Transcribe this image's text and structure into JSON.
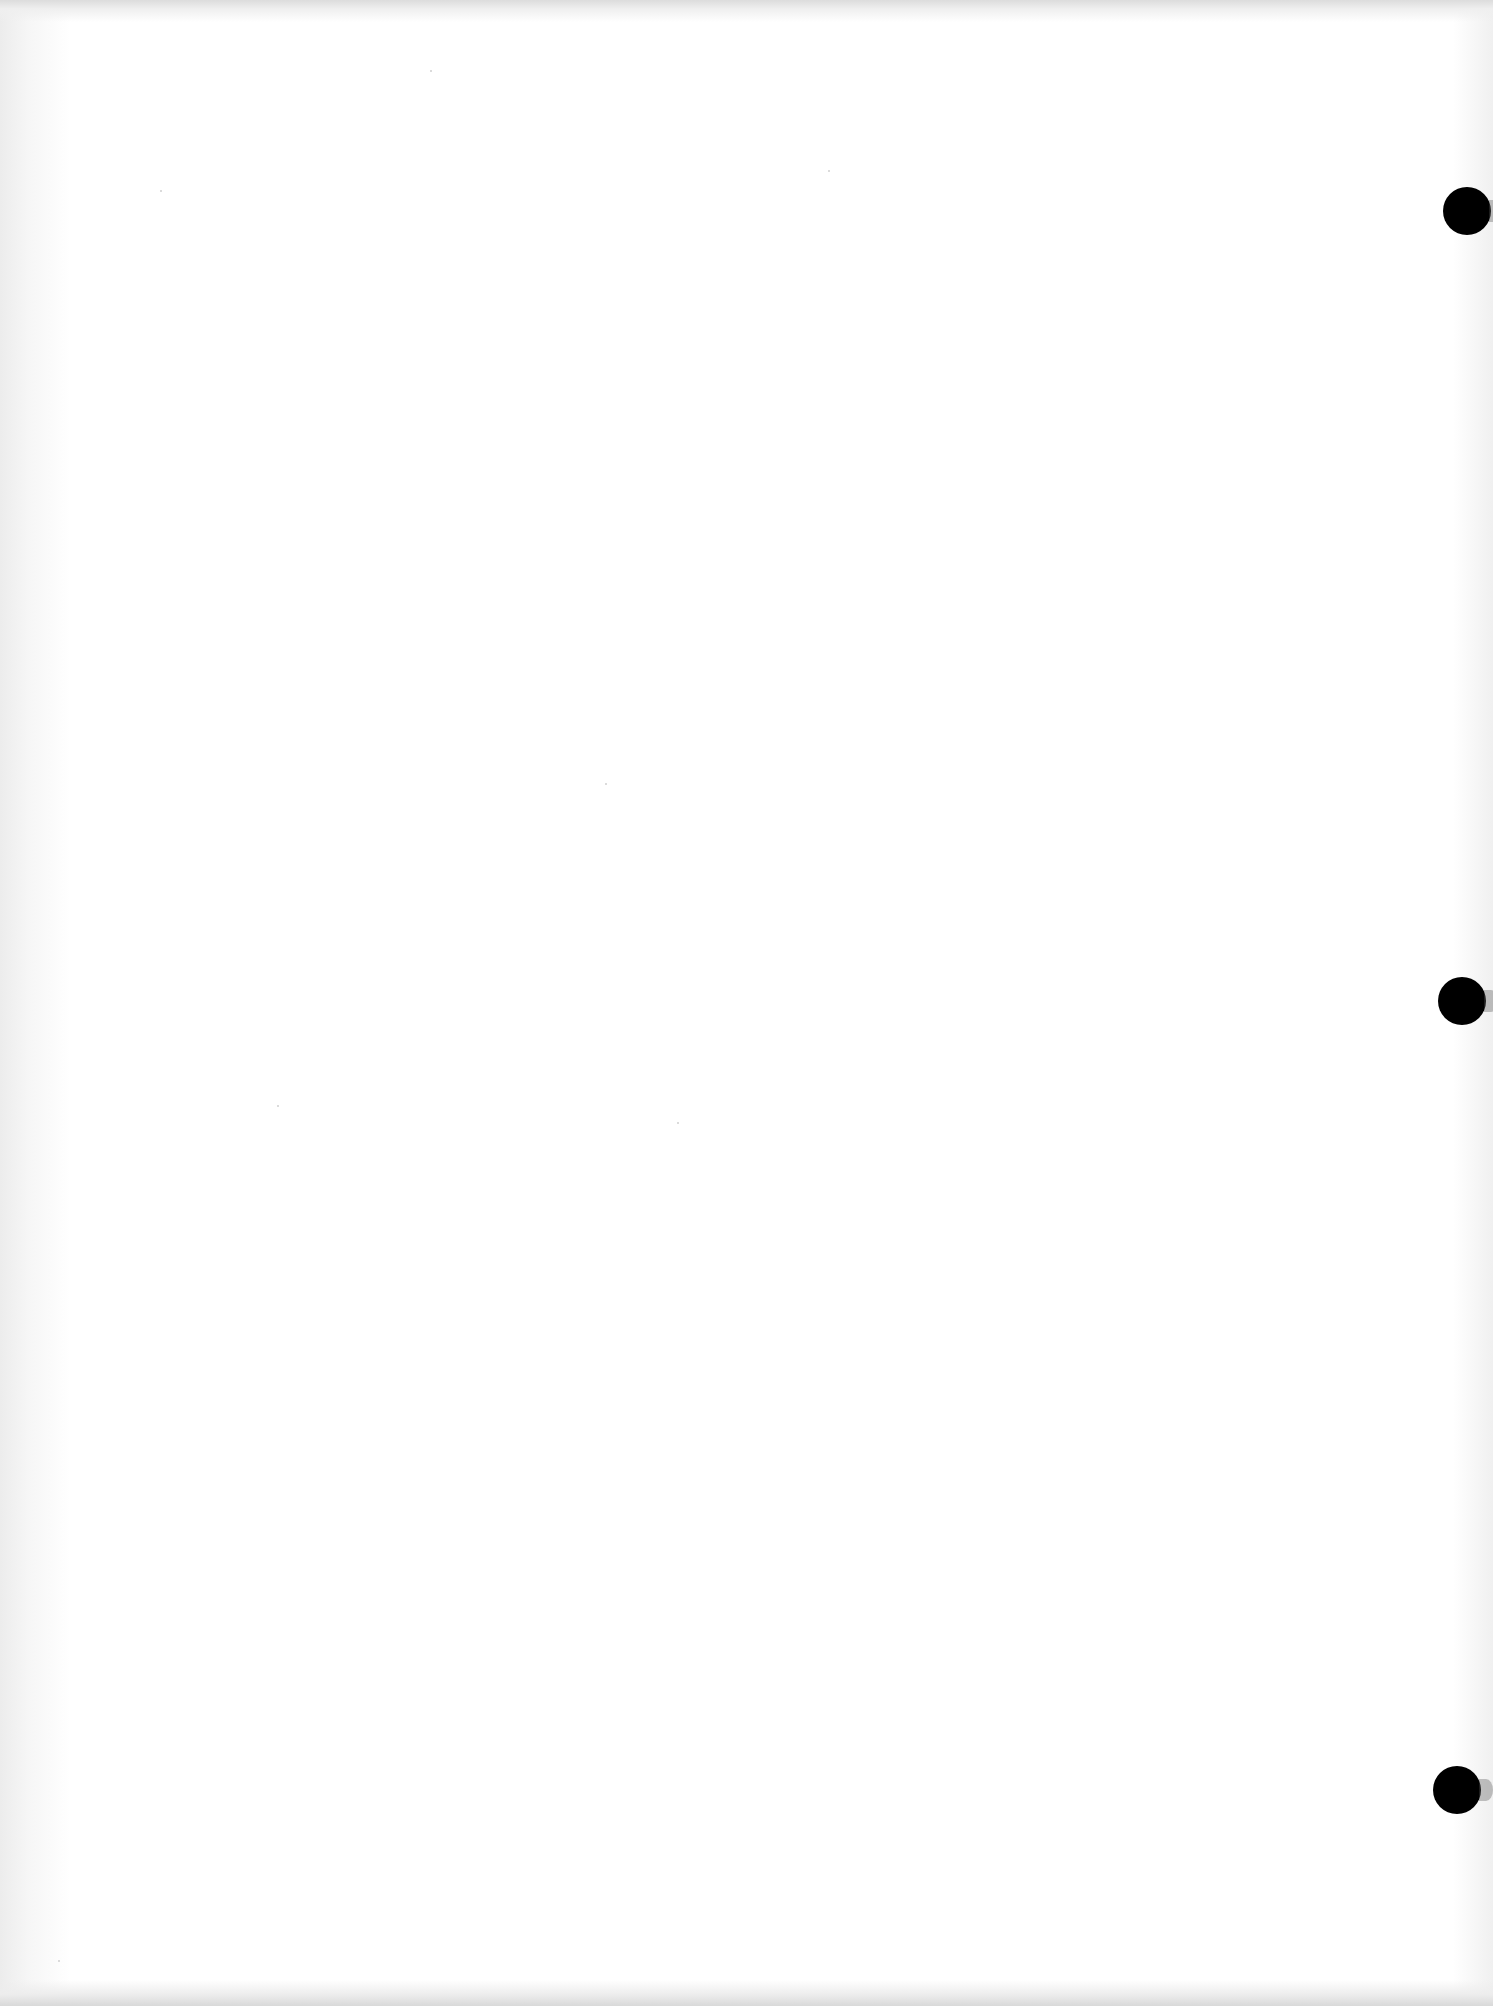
{
  "document": {
    "description": "Blank scanned sheet of three-hole-punched paper",
    "text_content": "",
    "background_color": "#ffffff"
  },
  "punch_holes": [
    {
      "label": "top-hole",
      "cx": 1467,
      "cy": 211,
      "diameter": 48,
      "color": "#000000"
    },
    {
      "label": "middle-hole",
      "cx": 1462,
      "cy": 1001,
      "diameter": 48,
      "color": "#000000"
    },
    {
      "label": "bottom-hole",
      "cx": 1457,
      "cy": 1790,
      "diameter": 48,
      "color": "#000000"
    }
  ]
}
